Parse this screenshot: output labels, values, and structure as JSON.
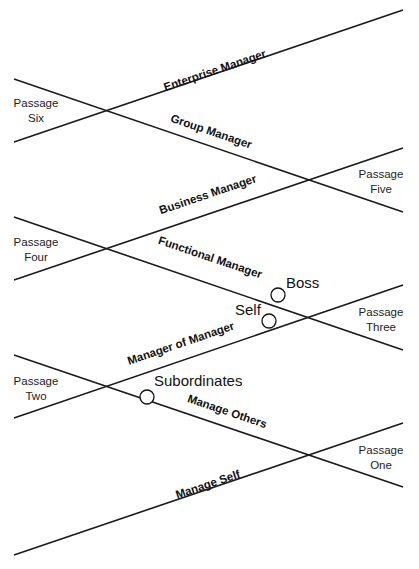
{
  "diagram": {
    "levels": [
      {
        "label": "Enterprise Manager",
        "x": 216,
        "y": 74,
        "angle": -18.7
      },
      {
        "label": "Group Manager",
        "x": 210,
        "y": 135,
        "angle": 18.7
      },
      {
        "label": "Business Manager",
        "x": 209,
        "y": 198,
        "angle": -18.7
      },
      {
        "label": "Functional Manager",
        "x": 209,
        "y": 261,
        "angle": 18.7
      },
      {
        "label": "Manager of Manager",
        "x": 182,
        "y": 347,
        "angle": -18.7
      },
      {
        "label": "Manage Others",
        "x": 226,
        "y": 415,
        "angle": 18.7
      },
      {
        "label": "Manage Self",
        "x": 209,
        "y": 488,
        "angle": -18.7
      }
    ],
    "passages": [
      {
        "line1": "Passage",
        "line2": "Six",
        "x": 36,
        "y": 107
      },
      {
        "line1": "Passage",
        "line2": "Five",
        "x": 381,
        "y": 178
      },
      {
        "line1": "Passage",
        "line2": "Four",
        "x": 36,
        "y": 246
      },
      {
        "line1": "Passage",
        "line2": "Three",
        "x": 381,
        "y": 316
      },
      {
        "line1": "Passage",
        "line2": "Two",
        "x": 36,
        "y": 385
      },
      {
        "line1": "Passage",
        "line2": "One",
        "x": 381,
        "y": 454
      }
    ],
    "roles": [
      {
        "label": "Boss",
        "x": 286,
        "y": 288
      },
      {
        "label": "Self",
        "x": 235,
        "y": 315
      },
      {
        "label": "Subordinates",
        "x": 154,
        "y": 386
      }
    ],
    "markers": [
      {
        "name": "boss-marker",
        "cx": 278,
        "cy": 295
      },
      {
        "name": "self-marker",
        "cx": 269,
        "cy": 321
      },
      {
        "name": "subordinates-marker",
        "cx": 147,
        "cy": 397
      }
    ]
  }
}
